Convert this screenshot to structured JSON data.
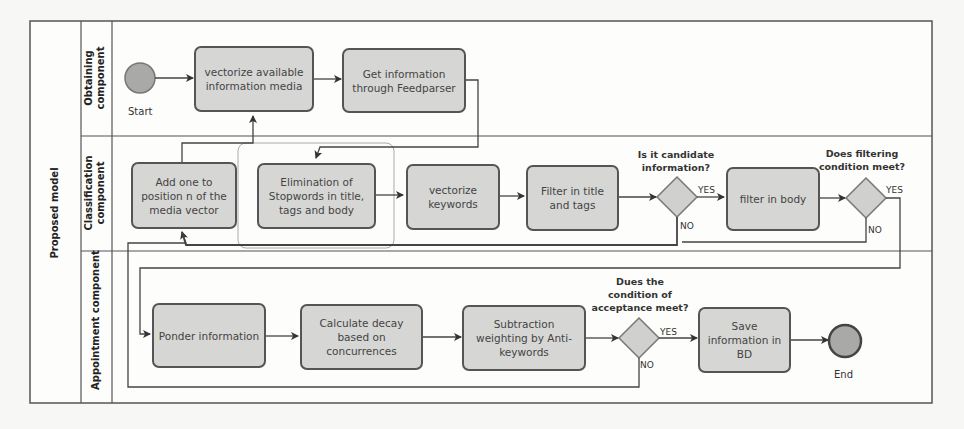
{
  "pool": {
    "label": "Proposed model"
  },
  "lanes": [
    {
      "id": "obtaining",
      "label_lines": [
        "Obtaining",
        "component"
      ]
    },
    {
      "id": "classification",
      "label_lines": [
        "Classification",
        "component"
      ]
    },
    {
      "id": "appointment",
      "label_lines": [
        "Appointment component"
      ]
    }
  ],
  "events": {
    "start": {
      "label": "Start"
    },
    "end": {
      "label": "End"
    }
  },
  "tasks": {
    "vectorize_media": "vectorize available information media",
    "get_info": "Get information through Feedparser",
    "add_one": "Add one to position n of the media vector",
    "elimination": "Elimination of Stopwords in title, tags and body",
    "vectorize_keywords": "vectorize keywords",
    "filter_title": "Filter in title and tags",
    "filter_body": "filter in body",
    "ponder": "Ponder information",
    "calc_decay": "Calculate decay based on concurrences",
    "subtraction": "Subtraction weighting by Anti-keywords",
    "save": "Save information in BD"
  },
  "gateways": {
    "candidate": {
      "question": "Is it candidate information?",
      "yes": "YES",
      "no": "NO"
    },
    "filtering": {
      "question": "Does filtering condition meet?",
      "yes": "YES",
      "no": "NO"
    },
    "acceptance": {
      "question": "Dues the condition of acceptance meet?",
      "yes": "YES",
      "no": "NO"
    }
  },
  "colors": {
    "task_fill": "#d6d6d4",
    "event_fill": "#a9a9a7",
    "line": "#444444"
  }
}
